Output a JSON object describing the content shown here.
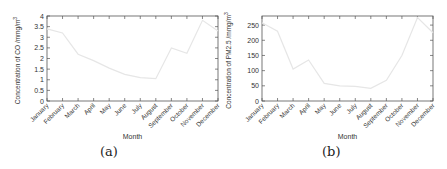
{
  "chart_data": [
    {
      "type": "line",
      "panel": "(a)",
      "title": "",
      "xlabel": "Month",
      "ylabel": "Concentration of CO /mmg/m³",
      "ylabel_text": "Concentration of CO /mmg/m",
      "ylabel_sup": "3",
      "categories": [
        "January",
        "February",
        "March",
        "April",
        "May",
        "June",
        "July",
        "August",
        "September",
        "October",
        "November",
        "December"
      ],
      "series": [
        {
          "name": "CO",
          "values": [
            3.4,
            3.2,
            2.2,
            1.9,
            1.55,
            1.25,
            1.1,
            1.05,
            2.5,
            2.25,
            3.8,
            3.3
          ]
        }
      ],
      "ylim": [
        0,
        4
      ],
      "yticks": [
        0,
        0.5,
        1,
        1.5,
        2,
        2.5,
        3,
        3.5,
        4
      ],
      "ytick_labels": [
        "0",
        "0.5",
        "1",
        "1.5",
        "2",
        "2.5",
        "3",
        "3.5",
        "4"
      ],
      "grid": false,
      "line_color": "#e6e6e6"
    },
    {
      "type": "line",
      "panel": "(b)",
      "title": "",
      "xlabel": "Month",
      "ylabel": "Concentration of PM2.5 /mmg/m³",
      "ylabel_text": "Concentration of PM2.5 /mmg/m",
      "ylabel_sup": "3",
      "categories": [
        "January",
        "February",
        "March",
        "April",
        "May",
        "June",
        "July",
        "August",
        "September",
        "October",
        "November",
        "December"
      ],
      "series": [
        {
          "name": "PM2.5",
          "values": [
            258,
            230,
            105,
            135,
            58,
            50,
            48,
            42,
            68,
            150,
            275,
            225
          ]
        }
      ],
      "ylim": [
        0,
        280
      ],
      "yticks": [
        0,
        50,
        100,
        150,
        200,
        250
      ],
      "ytick_labels": [
        "0",
        "50",
        "100",
        "150",
        "200",
        "250"
      ],
      "grid": false,
      "line_color": "#e6e6e6"
    }
  ],
  "captions": {
    "a": "(a)",
    "b": "(b)"
  }
}
